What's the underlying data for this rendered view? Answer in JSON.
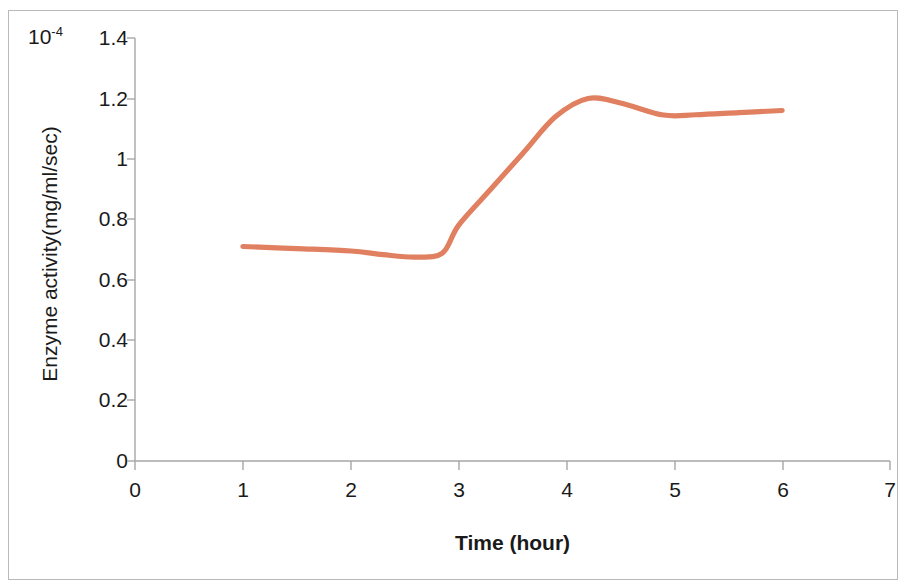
{
  "axis_multiplier": "10",
  "axis_multiplier_exponent": "-4",
  "titles": {
    "x": "Time (hour)",
    "y": "Enzyme activity(mg/ml/sec)"
  },
  "ticks": {
    "y": [
      "0",
      "0.2",
      "0.4",
      "0.6",
      "0.8",
      "1",
      "1.2",
      "1.4"
    ],
    "x": [
      "0",
      "1",
      "2",
      "3",
      "4",
      "5",
      "6",
      "7"
    ]
  },
  "colors": {
    "line": "#e08060",
    "axis": "#a6a6a6",
    "text": "#1a1a1a",
    "frame": "#b9b9b9",
    "background": "#ffffff"
  },
  "chart_data": {
    "type": "line",
    "title": "",
    "xlabel": "Time (hour)",
    "ylabel": "Enzyme activity(mg/ml/sec)",
    "y_multiplier": 0.0001,
    "y_multiplier_label": "10^-4",
    "xlim": [
      0,
      7
    ],
    "ylim": [
      0,
      1.4
    ],
    "xticks": [
      0,
      1,
      2,
      3,
      4,
      5,
      6,
      7
    ],
    "yticks": [
      0,
      0.2,
      0.4,
      0.6,
      0.8,
      1,
      1.2,
      1.4
    ],
    "grid": false,
    "legend": false,
    "smoothed": true,
    "series": [
      {
        "name": "Enzyme activity",
        "color": "#e08060",
        "x": [
          1,
          2,
          3,
          4,
          5,
          6
        ],
        "values": [
          0.71,
          0.695,
          0.78,
          1.195,
          1.145,
          1.16
        ]
      }
    ],
    "curve_points": [
      {
        "x": 1.0,
        "y": 0.71
      },
      {
        "x": 1.5,
        "y": 0.703
      },
      {
        "x": 2.0,
        "y": 0.695
      },
      {
        "x": 2.3,
        "y": 0.683
      },
      {
        "x": 2.6,
        "y": 0.675
      },
      {
        "x": 2.85,
        "y": 0.688
      },
      {
        "x": 3.0,
        "y": 0.78
      },
      {
        "x": 3.3,
        "y": 0.9
      },
      {
        "x": 3.6,
        "y": 1.02
      },
      {
        "x": 3.9,
        "y": 1.14
      },
      {
        "x": 4.2,
        "y": 1.2
      },
      {
        "x": 4.5,
        "y": 1.185
      },
      {
        "x": 4.9,
        "y": 1.145
      },
      {
        "x": 5.2,
        "y": 1.146
      },
      {
        "x": 5.6,
        "y": 1.153
      },
      {
        "x": 6.0,
        "y": 1.16
      }
    ],
    "annotations": [
      {
        "text": "local minimum near x=2.6",
        "x": 2.6,
        "y": 0.675
      },
      {
        "text": "peak near x=4.2",
        "x": 4.2,
        "y": 1.2
      }
    ]
  }
}
